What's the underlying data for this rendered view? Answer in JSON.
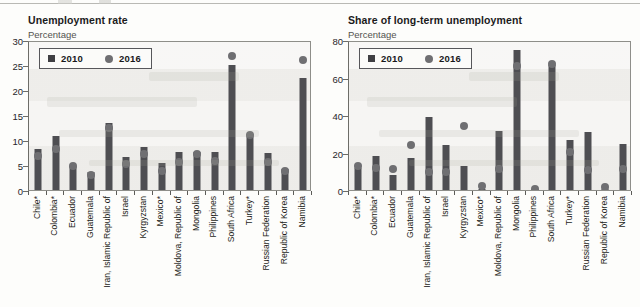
{
  "categories": [
    "Chile*",
    "Colombia*",
    "Ecuador",
    "Guatemala",
    "Iran, Islamic Republic of",
    "Israel",
    "Kyrgyzstan",
    "Mexico*",
    "Moldova, Republic of",
    "Mongolia",
    "Philippines",
    "South Africa",
    "Turkey*",
    "Russian Federation",
    "Republic of Korea",
    "Namibia"
  ],
  "legend": {
    "series_2010": "2010",
    "series_2016": "2016"
  },
  "colors": {
    "bar_2010": "#4e4e52",
    "dot_2016": "#6f6f72",
    "plot_bg": "#f2f1ee",
    "axis": "#6d6d68"
  },
  "panels": {
    "left": {
      "title": "Unemployment rate",
      "subtitle": "Percentage"
    },
    "right": {
      "title": "Share of long-term unemployment",
      "subtitle": "Percentage"
    }
  },
  "chart_data": [
    {
      "type": "bar",
      "title": "Unemployment rate",
      "subtitle": "Percentage",
      "xlabel": "",
      "ylabel": "Percentage",
      "ylim": [
        0,
        30
      ],
      "yticks": [
        0,
        5,
        10,
        15,
        20,
        25,
        30
      ],
      "grid": false,
      "legend_position": "top-left",
      "categories": [
        "Chile*",
        "Colombia*",
        "Ecuador",
        "Guatemala",
        "Iran, Islamic Republic of",
        "Israel",
        "Kyrgyzstan",
        "Mexico*",
        "Moldova, Republic of",
        "Mongolia",
        "Philippines",
        "South Africa",
        "Turkey*",
        "Russian Federation",
        "Republic of Korea",
        "Namibia"
      ],
      "series": [
        {
          "name": "2010",
          "marker": "bar",
          "values": [
            8.3,
            10.9,
            4.8,
            3.6,
            13.5,
            6.6,
            8.7,
            5.5,
            7.7,
            7.6,
            7.7,
            25.0,
            11.2,
            7.4,
            4.3,
            22.5
          ]
        },
        {
          "name": "2016",
          "marker": "circle",
          "values": [
            6.8,
            8.2,
            4.8,
            3.0,
            12.5,
            5.2,
            7.3,
            3.9,
            5.7,
            7.3,
            5.8,
            26.9,
            11.1,
            5.6,
            3.8,
            26.0
          ]
        }
      ]
    },
    {
      "type": "bar",
      "title": "Share of long-term unemployment",
      "subtitle": "Percentage",
      "xlabel": "",
      "ylabel": "Percentage",
      "ylim": [
        0,
        80
      ],
      "yticks": [
        0,
        20,
        40,
        60,
        80
      ],
      "grid": false,
      "legend_position": "top-left",
      "categories": [
        "Chile*",
        "Colombia*",
        "Ecuador",
        "Guatemala",
        "Iran, Islamic Republic of",
        "Israel",
        "Kyrgyzstan",
        "Mexico*",
        "Moldova, Republic of",
        "Mongolia",
        "Philippines",
        "South Africa",
        "Turkey*",
        "Russian Federation",
        "Republic of Korea",
        "Namibia"
      ],
      "series": [
        {
          "name": "2010",
          "marker": "bar",
          "values": [
            11.8,
            18.2,
            7.9,
            17.3,
            39.0,
            24.0,
            12.7,
            0.5,
            31.3,
            74.5,
            0.5,
            66.8,
            26.7,
            31.2,
            0.6,
            24.6
          ]
        },
        {
          "name": "2016",
          "marker": "circle",
          "values": [
            12.9,
            11.8,
            11.2,
            23.8,
            9.8,
            9.7,
            34.2,
            2.0,
            11.2,
            66.2,
            0.8,
            67.0,
            20.5,
            10.8,
            1.6,
            11.2
          ]
        }
      ]
    }
  ]
}
